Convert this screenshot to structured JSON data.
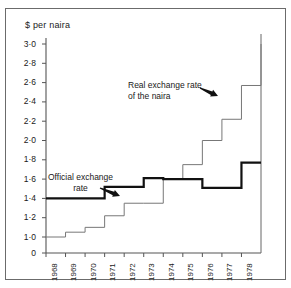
{
  "figure": {
    "background_color": "#ffffff",
    "frame_color": "#6b6b6b"
  },
  "axis": {
    "y_title": "$ per naira",
    "y_ticks": [
      "3·0",
      "2·8",
      "2·6",
      "2·4",
      "2·2",
      "2·0",
      "1·8",
      "1·6",
      "1·4",
      "1·2",
      "1·0",
      "0"
    ],
    "x_ticks": [
      "1968",
      "1969",
      "1970",
      "1971",
      "1972",
      "1973",
      "1974",
      "1975",
      "1976",
      "1977",
      "1978"
    ]
  },
  "annotations": {
    "real": {
      "line1": "Real exchange rate",
      "line2": "of the naira"
    },
    "official": {
      "line1": "Official exchange",
      "line2": "rate"
    }
  },
  "chart_data": {
    "type": "line",
    "title": "",
    "subtitle": "",
    "xlabel": "",
    "ylabel": "$ per naira",
    "ylim": [
      1.0,
      3.1
    ],
    "y_break_below": 1.0,
    "xlim": [
      1968,
      1979
    ],
    "grid": false,
    "legend_position": "inline-annotation",
    "step_style": "post",
    "categories": [
      "1968",
      "1969",
      "1970",
      "1971",
      "1972",
      "1973",
      "1974",
      "1975",
      "1976",
      "1977",
      "1978",
      "1979"
    ],
    "series": [
      {
        "name": "Official exchange rate",
        "color": "#111111",
        "line_width": 2.2,
        "values": [
          1.4,
          1.4,
          1.4,
          1.52,
          1.52,
          1.61,
          1.6,
          1.6,
          1.51,
          1.51,
          1.77,
          1.77
        ]
      },
      {
        "name": "Real exchange rate of the naira",
        "color": "#777777",
        "line_width": 1.0,
        "values": [
          1.0,
          1.05,
          1.1,
          1.22,
          1.35,
          1.35,
          1.6,
          1.75,
          2.0,
          2.22,
          2.57,
          3.0
        ]
      }
    ]
  }
}
